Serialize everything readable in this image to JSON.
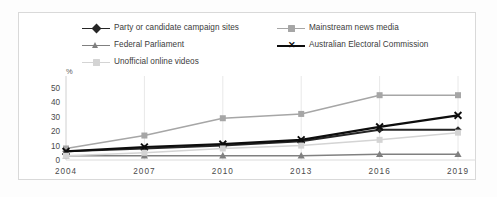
{
  "chart_data": {
    "type": "line",
    "title": "",
    "subtitle": "",
    "xlabel": "",
    "ylabel": "%",
    "categories": [
      "2004",
      "2007",
      "2010",
      "2013",
      "2016",
      "2019"
    ],
    "x": [
      2004,
      2007,
      2010,
      2013,
      2016,
      2019
    ],
    "ylim": [
      0,
      50
    ],
    "yticks": [
      0,
      10,
      20,
      30,
      40,
      50
    ],
    "grid": "vertical",
    "legend_position": "top",
    "series": [
      {
        "name": "Party or candidate campaign sites",
        "marker": "diamond",
        "color": "#262626",
        "values": [
          6,
          8,
          10,
          13,
          21,
          21
        ]
      },
      {
        "name": "Mainstream news media",
        "marker": "square",
        "color": "#a6a6a6",
        "values": [
          8,
          17,
          29,
          32,
          45,
          45
        ]
      },
      {
        "name": "Federal Parliament",
        "marker": "triangle",
        "color": "#808080",
        "values": [
          3,
          3,
          3,
          3,
          4,
          4
        ]
      },
      {
        "name": "Australian Electoral Commission",
        "marker": "x",
        "color": "#0d0d0d",
        "values": [
          6,
          9,
          11,
          14,
          23,
          31
        ]
      },
      {
        "name": "Unofficial online videos",
        "marker": "square",
        "color": "#d4d4d4",
        "values": [
          3,
          5,
          8,
          10,
          14,
          19
        ]
      }
    ]
  },
  "axes": {
    "unit_label": "%",
    "ytick_labels": [
      "50",
      "40",
      "30",
      "20",
      "10",
      "0"
    ],
    "xtick_labels": [
      "2004",
      "2007",
      "2010",
      "2013",
      "2016",
      "2019"
    ]
  },
  "legend": {
    "rows": [
      [
        {
          "label": "Party or candidate campaign sites",
          "marker": "diamond",
          "color": "#262626"
        },
        {
          "label": "Mainstream news media",
          "marker": "square",
          "color": "#a6a6a6"
        }
      ],
      [
        {
          "label": "Federal Parliament",
          "marker": "triangle",
          "color": "#808080"
        },
        {
          "label": "Australian Electoral Commission",
          "marker": "x",
          "color": "#0d0d0d"
        }
      ],
      [
        {
          "label": "Unofficial online videos",
          "marker": "square",
          "color": "#d4d4d4"
        }
      ]
    ]
  },
  "colors": {
    "background": "#ffffff",
    "frame": "#d9d9d9",
    "gridline": "#e8e8e8",
    "axis_text": "#4a4a4a"
  }
}
